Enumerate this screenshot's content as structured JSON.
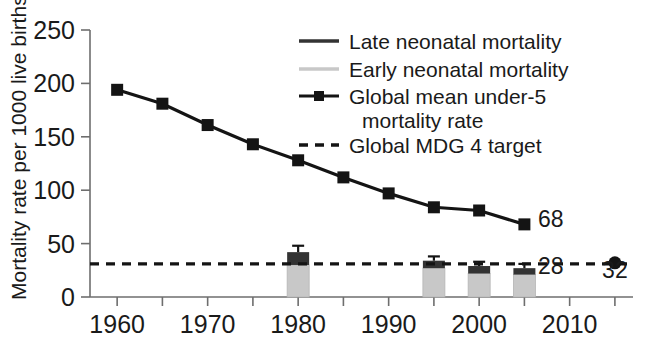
{
  "chart_data": {
    "type": "bar",
    "title": "",
    "xlabel": "",
    "ylabel": "Mortality rate per 1000 live births",
    "xlim": [
      1957,
      2017
    ],
    "ylim": [
      0,
      250
    ],
    "yticks": [
      0,
      50,
      100,
      150,
      200,
      250
    ],
    "ytick_labels": [
      "0",
      "50",
      "100",
      "150",
      "200",
      "250"
    ],
    "xticks": [
      1960,
      1965,
      1970,
      1975,
      1980,
      1985,
      1990,
      1995,
      2000,
      2005,
      2010,
      2015
    ],
    "xtick_labels": [
      "1960",
      "",
      "1970",
      "",
      "1980",
      "",
      "1990",
      "",
      "2000",
      "",
      "2010",
      ""
    ],
    "grid": false,
    "legend_position": "top-center-right",
    "series": [
      {
        "name": "Late neonatal mortality",
        "type": "bar-segment",
        "color": "#333333",
        "x": [
          1980,
          1995,
          2000,
          2005
        ],
        "values": [
          12,
          7,
          7,
          6
        ]
      },
      {
        "name": "Early neonatal mortality",
        "type": "bar-segment",
        "color": "#c8c8c8",
        "x": [
          1980,
          1995,
          2000,
          2005
        ],
        "values": [
          30,
          27,
          22,
          21
        ]
      },
      {
        "name": "Neonatal mortality total (bar height)",
        "type": "bar-total",
        "x": [
          1980,
          1995,
          2000,
          2005
        ],
        "values": [
          42,
          34,
          29,
          27
        ],
        "err_upper": [
          48,
          38,
          33,
          31
        ],
        "err_lower": [
          36,
          31,
          26,
          24
        ]
      },
      {
        "name": "Global mean under-5 mortality rate",
        "type": "line",
        "color": "#141414",
        "x": [
          1960,
          1965,
          1970,
          1975,
          1980,
          1985,
          1990,
          1995,
          2000,
          2005
        ],
        "values": [
          194,
          181,
          161,
          143,
          128,
          112,
          97,
          84,
          81,
          68
        ]
      },
      {
        "name": "Global MDG 4 target",
        "type": "hline",
        "color": "#141414",
        "value": 31
      },
      {
        "name": "MDG 4 target point 2015",
        "type": "point",
        "color": "#141414",
        "x": [
          2015
        ],
        "values": [
          32
        ]
      }
    ],
    "annotations": [
      {
        "text": "68",
        "x": 2006.5,
        "y": 66,
        "series": "Global mean under-5 mortality rate"
      },
      {
        "text": "28",
        "x": 2006.5,
        "y": 22,
        "series": "Neonatal mortality total"
      },
      {
        "text": "32",
        "x": 2015,
        "y": 18,
        "series": "MDG 4 target point 2015"
      }
    ]
  },
  "legend": {
    "items": [
      {
        "label": "Late neonatal mortality",
        "swatch": "solid-dark-line",
        "color": "#333333"
      },
      {
        "label": "Early neonatal mortality",
        "swatch": "solid-gray-line",
        "color": "#c8c8c8"
      },
      {
        "label": "Global mean under-5",
        "label2": "mortality rate",
        "swatch": "line-with-square-marker",
        "color": "#141414"
      },
      {
        "label": "Global MDG 4 target",
        "swatch": "dashed-line",
        "color": "#141414"
      }
    ]
  },
  "axes": {
    "y_title": "Mortality rate per 1000 live births"
  }
}
